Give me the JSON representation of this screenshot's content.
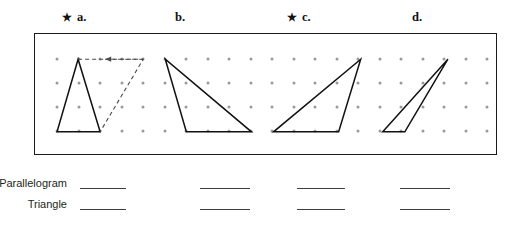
{
  "headers": [
    {
      "star": "★",
      "has_star": true,
      "label": "a.",
      "x": 62
    },
    {
      "star": "",
      "has_star": false,
      "label": "b.",
      "x": 175
    },
    {
      "star": "★",
      "has_star": true,
      "label": "c.",
      "x": 287
    },
    {
      "star": "",
      "has_star": false,
      "label": "d.",
      "x": 412
    }
  ],
  "grid": {
    "dot_color": "#9a9a9a",
    "border_color": "#1b1b1b",
    "columns": 21,
    "rows": 4,
    "x_start": 22,
    "x_step": 21.5,
    "y_start": 25,
    "y_step": 24
  },
  "figures": [
    {
      "name": "figure-a",
      "shape": "triangle",
      "stroke": "#111111",
      "points": "43,25 65,25 22,97 65,97",
      "triangle": "43,25 22,97 65,97",
      "dashed_completion": "43,25 108,25 65,97",
      "has_dashed_parallelogram": true,
      "arrow": {
        "from_x": 108,
        "to_x": 70,
        "y": 25
      }
    },
    {
      "name": "figure-b",
      "shape": "triangle",
      "stroke": "#111111",
      "triangle": "130,25 151,97 216,97",
      "has_dashed_parallelogram": false
    },
    {
      "name": "figure-c",
      "shape": "triangle",
      "stroke": "#111111",
      "triangle": "325,25 238,97 303,97",
      "has_dashed_parallelogram": false
    },
    {
      "name": "figure-d",
      "shape": "triangle",
      "stroke": "#111111",
      "triangle": "412,25 347,97 369,97",
      "has_dashed_parallelogram": false
    }
  ],
  "answers": {
    "rows": [
      {
        "label": "Parallelogram",
        "blanks": [
          {
            "x": 80,
            "width": 46
          },
          {
            "x": 200,
            "width": 50
          },
          {
            "x": 297,
            "width": 48
          },
          {
            "x": 400,
            "width": 50
          }
        ]
      },
      {
        "label": "Triangle",
        "blanks": [
          {
            "x": 80,
            "width": 46
          },
          {
            "x": 200,
            "width": 50
          },
          {
            "x": 297,
            "width": 48
          },
          {
            "x": 400,
            "width": 50
          }
        ]
      }
    ]
  }
}
